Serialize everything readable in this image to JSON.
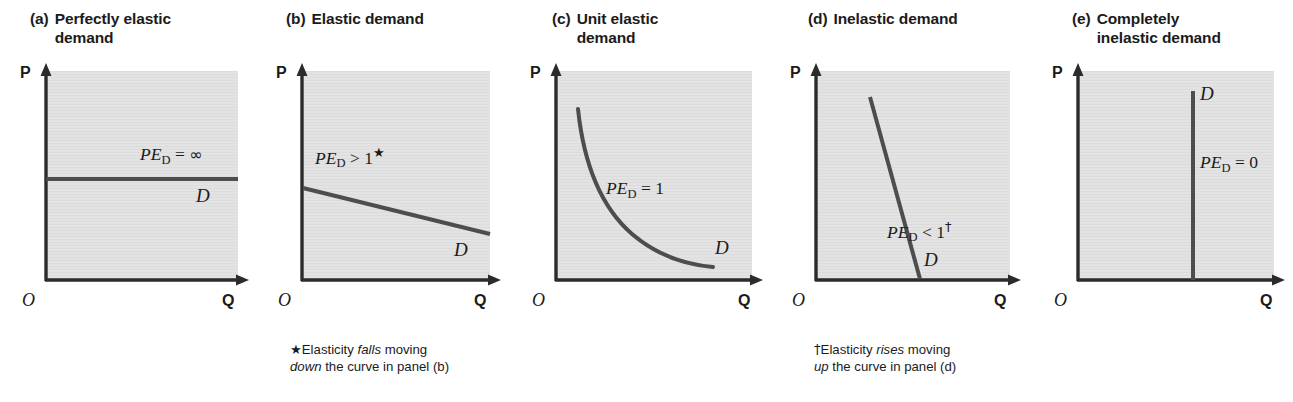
{
  "figure": {
    "style": {
      "plot_bg": "#e2e2e2",
      "axis_color": "#2b2b2b",
      "curve_color": "#4d4d4d",
      "text_color": "#1b1b1b"
    },
    "axis": {
      "y_label": "P",
      "x_label": "Q",
      "origin_label": "O"
    }
  },
  "panels": [
    {
      "id": "a",
      "tag": "(a)",
      "title": "Perfectly elastic demand",
      "title_line1": "Perfectly elastic",
      "title_line2": "demand",
      "curve_type": "horizontal",
      "elasticity_label": {
        "prefix": "PE",
        "subscript": "D",
        "relation": "=",
        "value": "∞",
        "mark": ""
      },
      "elasticity_text": "PE_D = ∞",
      "demand_label": "D",
      "footnote": null
    },
    {
      "id": "b",
      "tag": "(b)",
      "title": "Elastic demand",
      "title_line1": "Elastic demand",
      "title_line2": "",
      "curve_type": "shallow-downward-line",
      "elasticity_label": {
        "prefix": "PE",
        "subscript": "D",
        "relation": ">",
        "value": "1",
        "mark": "★"
      },
      "elasticity_text": "PE_D > 1",
      "demand_label": "D",
      "footnote": {
        "mark": "★",
        "line1_before": "Elasticity ",
        "line1_em": "falls",
        "line1_after": " moving",
        "line2_em": "down",
        "line2_after": " the curve in panel (b)",
        "full": "★ Elasticity falls moving down the curve in panel (b)"
      }
    },
    {
      "id": "c",
      "tag": "(c)",
      "title": "Unit elastic demand",
      "title_line1": "Unit elastic",
      "title_line2": "demand",
      "curve_type": "rectangular-hyperbola",
      "elasticity_label": {
        "prefix": "PE",
        "subscript": "D",
        "relation": "=",
        "value": "1",
        "mark": ""
      },
      "elasticity_text": "PE_D = 1",
      "demand_label": "D",
      "footnote": null
    },
    {
      "id": "d",
      "tag": "(d)",
      "title": "Inelastic demand",
      "title_line1": "Inelastic demand",
      "title_line2": "",
      "curve_type": "steep-downward-line",
      "elasticity_label": {
        "prefix": "PE",
        "subscript": "D",
        "relation": "<",
        "value": "1",
        "mark": "†"
      },
      "elasticity_text": "PE_D < 1",
      "demand_label": "D",
      "footnote": {
        "mark": "†",
        "line1_before": "Elasticity ",
        "line1_em": "rises",
        "line1_after": " moving",
        "line2_em": "up",
        "line2_after": " the curve in panel (d)",
        "full": "† Elasticity rises moving up the curve in panel (d)"
      }
    },
    {
      "id": "e",
      "tag": "(e)",
      "title": "Completely inelastic demand",
      "title_line1": "Completely",
      "title_line2": "inelastic demand",
      "curve_type": "vertical",
      "elasticity_label": {
        "prefix": "PE",
        "subscript": "D",
        "relation": "=",
        "value": "0",
        "mark": ""
      },
      "elasticity_text": "PE_D = 0",
      "demand_label": "D",
      "footnote": null
    }
  ]
}
